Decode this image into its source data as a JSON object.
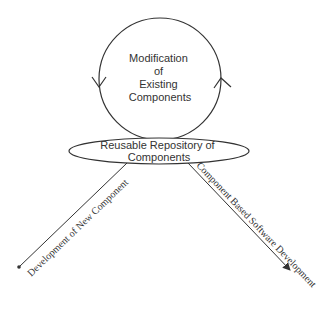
{
  "diagram": {
    "cycle_node": {
      "lines": [
        "Modification",
        "of",
        "Existing",
        "Components"
      ]
    },
    "repository_node": {
      "lines": [
        "Reusable Repository of",
        "Components"
      ]
    },
    "left_branch": {
      "label": "Development of New Component",
      "end_marker": "dot"
    },
    "right_branch": {
      "label": "Component Based Software Development",
      "end_marker": "arrow"
    },
    "colors": {
      "stroke": "#333333",
      "text": "#333333",
      "background": "#ffffff"
    }
  }
}
